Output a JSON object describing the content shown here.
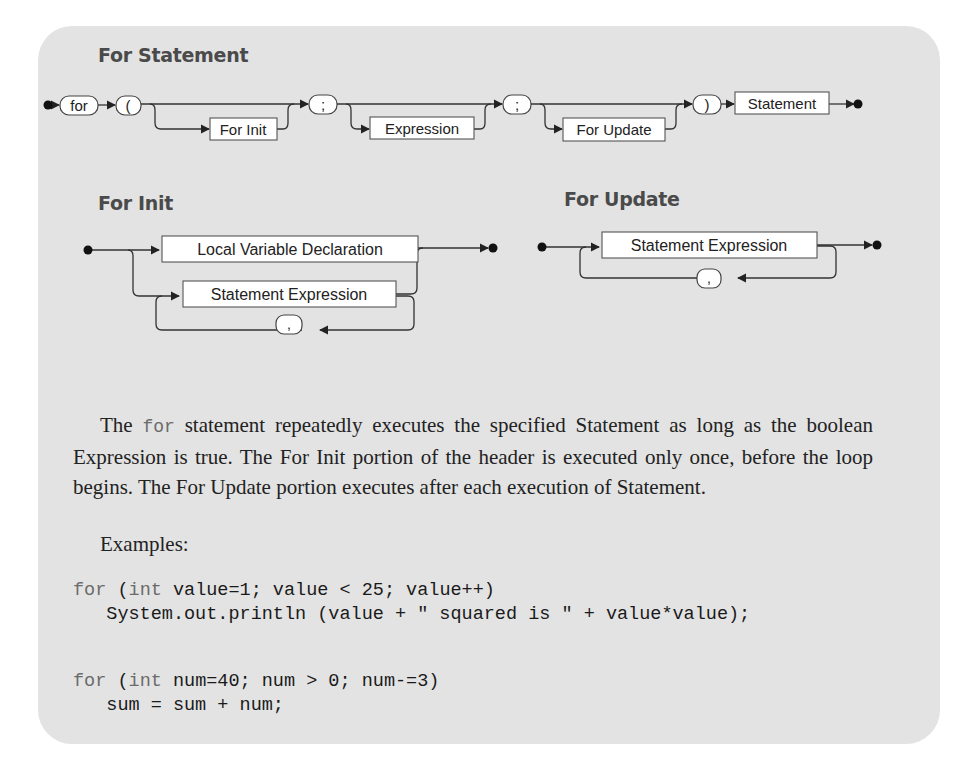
{
  "sections": {
    "for_statement": {
      "title": "For Statement",
      "terminals": [
        "for",
        "(",
        ";",
        ";",
        ")"
      ],
      "nonterminals": [
        "For Init",
        "Expression",
        "For Update",
        "Statement"
      ]
    },
    "for_init": {
      "title": "For Init",
      "nonterminals": [
        "Local Variable Declaration",
        "Statement Expression"
      ],
      "separator": ","
    },
    "for_update": {
      "title": "For Update",
      "nonterminals": [
        "Statement Expression"
      ],
      "separator": ","
    }
  },
  "description": {
    "prefix": "The ",
    "keyword": "for",
    "rest": " statement repeatedly executes the specified Statement as long as the boolean Expression is true. The For Init portion of the header is executed only once, before the loop begins. The For Update portion executes after each execution of Statement."
  },
  "examples_label": "Examples:",
  "examples": [
    {
      "line1": {
        "kw1": "for",
        "p1": " (",
        "kw2": "int",
        "rest": " value=1; value < 25; value++)"
      },
      "line2": "   System.out.println (value + \" squared is \" + value*value);"
    },
    {
      "line1": {
        "kw1": "for",
        "p1": " (",
        "kw2": "int",
        "rest": " num=40; num > 0; num-=3)"
      },
      "line2": "   sum = sum + num;"
    }
  ],
  "colors": {
    "panel": "#e3e3e3",
    "heading": "#4a4a4a",
    "keyword": "#6b6b6b",
    "box_fill": "#ffffff",
    "line": "#333333"
  }
}
